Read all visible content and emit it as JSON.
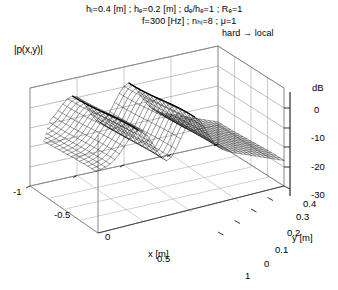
{
  "figure": {
    "kind": "3d-surface-wireframe",
    "zaxis_label": "|p(x,y)|"
  },
  "header": {
    "line1": "hᵢ=0.4 [m]  ;   hₑ=0.2 [m]  ;   dₑ/hₑ=1  ;   Rₑ=1",
    "line2": "f=300 [Hz]  ;   nₕᵢ=8  ;   μ=1",
    "line3": "hard → local"
  },
  "axes": {
    "x": {
      "label": "x [m]",
      "ticks": [
        "-1",
        "-0.5",
        "0",
        "0.5",
        "1"
      ]
    },
    "y": {
      "label": "y [m]",
      "ticks": [
        "0",
        "0.1",
        "0.2",
        "0.3",
        "0.4"
      ]
    },
    "z": {
      "label": "dB",
      "ticks": [
        "0",
        "-10",
        "-20",
        "-30"
      ]
    }
  },
  "chart_data": {
    "type": "surface",
    "title": "",
    "xlabel": "x [m]",
    "ylabel": "y [m]",
    "zlabel": "dB",
    "xlim": [
      -1,
      1
    ],
    "ylim": [
      0,
      0.4
    ],
    "zlim": [
      -35,
      5
    ],
    "xticks": [
      -1,
      -0.5,
      0,
      0.5,
      1
    ],
    "yticks": [
      0,
      0.1,
      0.2,
      0.3,
      0.4
    ],
    "zticks": [
      0,
      -10,
      -20,
      -30
    ],
    "grid": true,
    "legend": "none",
    "quantity": "|p(x,y)|",
    "parameters": {
      "h_i": 0.4,
      "h_e": 0.2,
      "de_over_he": 1,
      "R_e": 1,
      "f_Hz": 300,
      "n_hi": 8,
      "mu": 1,
      "boundary": "hard → local"
    },
    "nx": 41,
    "ny": 17,
    "ridge_x_positions": [
      -0.55,
      0.05
    ],
    "x": [
      -1,
      -0.9,
      -0.8,
      -0.7,
      -0.6,
      -0.5,
      -0.4,
      -0.3,
      -0.2,
      -0.1,
      0,
      0.1,
      0.2,
      0.3,
      0.4,
      0.5,
      0.6,
      0.7,
      0.8,
      0.9,
      1
    ],
    "z_profile_dB": [
      -6,
      -4.5,
      -3,
      -1.5,
      -0.5,
      -0.2,
      -2,
      -5,
      -8,
      -3,
      -0.3,
      -2.5,
      -6,
      -10,
      -14,
      -18,
      -21,
      -24,
      -27,
      -29,
      -31
    ]
  }
}
